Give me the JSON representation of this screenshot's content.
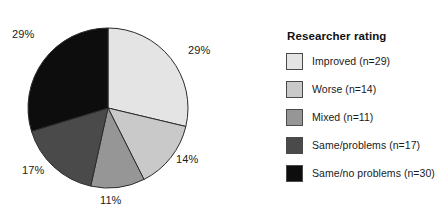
{
  "chart_data": {
    "type": "pie",
    "title": "",
    "legend_title": "Researcher rating",
    "legend_position": "right",
    "start_angle_deg": 0,
    "direction": "clockwise",
    "total_n": 101,
    "categories": [
      "Improved",
      "Worse",
      "Mixed",
      "Same/problems",
      "Same/no problems"
    ],
    "values": [
      29,
      14,
      11,
      17,
      30
    ],
    "percentages": [
      29,
      14,
      11,
      17,
      29
    ],
    "colors": [
      "#e4e4e4",
      "#c9c9c9",
      "#969696",
      "#4a4a4a",
      "#0d0d0d"
    ],
    "slices": [
      {
        "label": "Improved",
        "n": 29,
        "percent": 29,
        "percent_text": "29%",
        "color": "#e4e4e4",
        "legend_text": "Improved (n=29)"
      },
      {
        "label": "Worse",
        "n": 14,
        "percent": 14,
        "percent_text": "14%",
        "color": "#c9c9c9",
        "legend_text": "Worse (n=14)"
      },
      {
        "label": "Mixed",
        "n": 11,
        "percent": 11,
        "percent_text": "11%",
        "color": "#969696",
        "legend_text": "Mixed (n=11)"
      },
      {
        "label": "Same/problems",
        "n": 17,
        "percent": 17,
        "percent_text": "17%",
        "color": "#4a4a4a",
        "legend_text": "Same/problems (n=17)"
      },
      {
        "label": "Same/no problems",
        "n": 30,
        "percent": 29,
        "percent_text": "29%",
        "color": "#0d0d0d",
        "legend_text": "Same/no problems (n=30)"
      }
    ]
  },
  "pie": {
    "labels": {
      "improved": "29%",
      "worse": "14%",
      "mixed": "11%",
      "same_problems": "17%",
      "same_no_problems": "29%"
    }
  },
  "legend": {
    "title": "Researcher rating",
    "items": [
      {
        "label": "Improved (n=29)",
        "color": "#e4e4e4"
      },
      {
        "label": "Worse (n=14)",
        "color": "#c9c9c9"
      },
      {
        "label": "Mixed (n=11)",
        "color": "#969696"
      },
      {
        "label": "Same/problems (n=17)",
        "color": "#4a4a4a"
      },
      {
        "label": "Same/no problems (n=30)",
        "color": "#0d0d0d"
      }
    ]
  }
}
